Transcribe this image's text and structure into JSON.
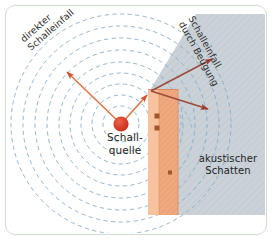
{
  "figure": {
    "frame_color": "#cfe0cd",
    "background": "#ffffff"
  },
  "labels": {
    "direct_sound": "direkter\nSchalleinfall",
    "diffracted_sound": "Schalleinfall\ndurch Beugung",
    "source": "Schall-\nquelle",
    "shadow": "akustischer\nSchatten"
  },
  "elements": {
    "source_point": {
      "name": "Schallquelle",
      "x": 121,
      "y": 124,
      "radius": 7.5,
      "color": "#d8412a"
    },
    "wall": {
      "name": "Wand",
      "x": 148,
      "y": 89,
      "width": 30,
      "height": 126,
      "face_color": "#f6b48b",
      "side_color": "#e8946a"
    },
    "shadow_zone": {
      "name": "akustischer Schatten",
      "color": "#c3ccd2"
    },
    "wave_fronts": {
      "name": "Schallwellen",
      "color": "#7fa8c9",
      "count": 9,
      "style": "dashed-concentric"
    }
  },
  "arrows": [
    {
      "name": "direct-sound-ray",
      "from": [
        121,
        124
      ],
      "to": [
        64,
        69
      ],
      "color": "#e06b3c"
    },
    {
      "name": "incident-ray-to-edge",
      "from": [
        121,
        124
      ],
      "to": [
        150,
        92
      ],
      "color": "#e06b3c"
    },
    {
      "name": "diffracted-ray-up",
      "from": [
        152,
        92
      ],
      "to": [
        216,
        57
      ],
      "color": "#9c4a3c"
    },
    {
      "name": "diffracted-ray-down",
      "from": [
        152,
        92
      ],
      "to": [
        212,
        112
      ],
      "color": "#9c4a3c"
    }
  ],
  "wall_marks": [
    {
      "x": 157,
      "y": 116
    },
    {
      "x": 157,
      "y": 128
    },
    {
      "x": 170,
      "y": 173
    }
  ]
}
